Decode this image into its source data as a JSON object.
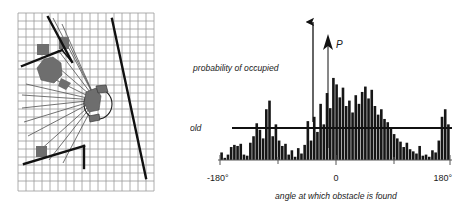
{
  "figure": {
    "caption_present": false,
    "panels": [
      "occupancy-grid-map",
      "angular-occupancy-histogram"
    ]
  },
  "map": {
    "name": "occupancy grid with sonar/laser rays",
    "grid_color": "#8c8c8c",
    "obstacle_color": "#6e6e6e",
    "wall_color": "#1a1a1a",
    "ray_color": "#555555",
    "robot_label": "",
    "grid_cols": 17,
    "grid_rows": 22
  },
  "chart_data": {
    "type": "bar",
    "title": "",
    "subtitle": "",
    "xlabel": "angle at which obstacle is found",
    "ylabel": "probability of occupied",
    "y_axis_symbol": "P",
    "threshold_label": "threshold",
    "threshold_value": 0.3,
    "xlim": [
      -180,
      180
    ],
    "ylim": [
      0,
      1.0
    ],
    "grid": false,
    "legend": null,
    "xticks": [
      -180,
      -90,
      0,
      90,
      180
    ],
    "xticklabels": [
      "-180°",
      "",
      "0",
      "",
      "180°"
    ],
    "bar_count": 72,
    "x": [
      -177.5,
      -172.5,
      -167.5,
      -162.5,
      -157.5,
      -152.5,
      -147.5,
      -142.5,
      -137.5,
      -132.5,
      -127.5,
      -122.5,
      -117.5,
      -112.5,
      -107.5,
      -102.5,
      -97.5,
      -92.5,
      -87.5,
      -82.5,
      -77.5,
      -72.5,
      -67.5,
      -62.5,
      -57.5,
      -52.5,
      -47.5,
      -42.5,
      -37.5,
      -32.5,
      -27.5,
      -22.5,
      -17.5,
      -12.5,
      -7.5,
      -2.5,
      2.5,
      7.5,
      12.5,
      17.5,
      22.5,
      27.5,
      32.5,
      37.5,
      42.5,
      47.5,
      52.5,
      57.5,
      62.5,
      67.5,
      72.5,
      77.5,
      82.5,
      87.5,
      92.5,
      97.5,
      102.5,
      107.5,
      112.5,
      117.5,
      122.5,
      127.5,
      132.5,
      137.5,
      142.5,
      147.5,
      152.5,
      157.5,
      162.5,
      167.5,
      172.5,
      177.5
    ],
    "values": [
      0.07,
      0.02,
      0.05,
      0.12,
      0.14,
      0.13,
      0.15,
      0.05,
      0.04,
      0.16,
      0.22,
      0.34,
      0.28,
      0.2,
      0.47,
      0.55,
      0.22,
      0.33,
      0.18,
      0.13,
      0.15,
      0.05,
      0.09,
      0.03,
      0.11,
      0.06,
      0.14,
      0.36,
      0.18,
      0.4,
      0.26,
      0.52,
      0.33,
      0.62,
      0.48,
      0.76,
      0.7,
      0.58,
      0.67,
      0.5,
      0.55,
      0.44,
      0.6,
      0.52,
      0.63,
      0.68,
      0.57,
      0.65,
      0.5,
      0.42,
      0.47,
      0.38,
      0.35,
      0.29,
      0.24,
      0.2,
      0.17,
      0.12,
      0.16,
      0.1,
      0.08,
      0.06,
      0.13,
      0.04,
      0.05,
      0.03,
      0.09,
      0.07,
      0.18,
      0.4,
      0.47,
      0.33
    ],
    "annotations": [
      {
        "name": "probability-of-occupied-arrow",
        "text": "probability of occupied",
        "points_to": "y-direction"
      },
      {
        "name": "P-axis-arrow",
        "text": "P",
        "points_to": "y-axis"
      }
    ]
  }
}
